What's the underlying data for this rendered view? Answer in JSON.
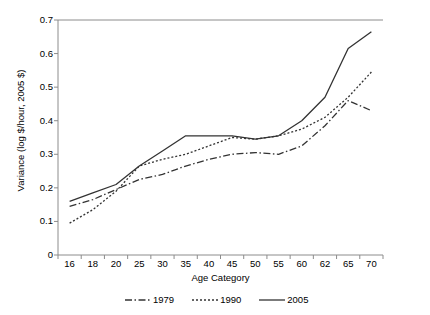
{
  "chart_data": {
    "type": "line",
    "title": "",
    "xlabel": "Age Category",
    "ylabel": "Variance (log $/hour, 2005 $)",
    "categories": [
      "16",
      "18",
      "20",
      "25",
      "30",
      "35",
      "40",
      "45",
      "50",
      "55",
      "60",
      "62",
      "65",
      "70"
    ],
    "yticks": [
      "0",
      "0.1",
      "0.2",
      "0.3",
      "0.4",
      "0.5",
      "0.6",
      "0.7"
    ],
    "ylim": [
      0,
      0.7
    ],
    "grid": false,
    "legend_position": "bottom",
    "series": [
      {
        "name": "1979",
        "style": "dash-dot",
        "color": "#333333",
        "values": [
          0.145,
          0.165,
          0.195,
          0.225,
          0.24,
          0.265,
          0.285,
          0.3,
          0.305,
          0.3,
          0.325,
          0.385,
          0.46,
          0.43
        ]
      },
      {
        "name": "1990",
        "style": "dotted",
        "color": "#333333",
        "values": [
          0.095,
          0.135,
          0.19,
          0.265,
          0.285,
          0.3,
          0.325,
          0.35,
          0.345,
          0.355,
          0.375,
          0.41,
          0.47,
          0.545
        ]
      },
      {
        "name": "2005",
        "style": "solid",
        "color": "#333333",
        "values": [
          0.16,
          0.185,
          0.21,
          0.265,
          0.31,
          0.355,
          0.355,
          0.355,
          0.345,
          0.355,
          0.4,
          0.47,
          0.615,
          0.665
        ]
      }
    ]
  },
  "axes": {
    "axis_color": "#8c8c8c"
  }
}
